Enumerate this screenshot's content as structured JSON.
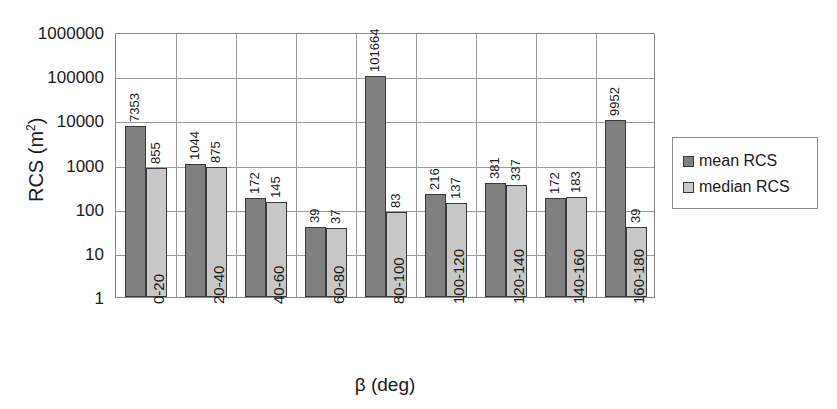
{
  "chart_data": {
    "type": "bar",
    "title": "",
    "xlabel": "β (deg)",
    "ylabel": "RCS (m²)",
    "ylabel_base": "RCS (m",
    "ylabel_sup": "2",
    "ylabel_close": ")",
    "yscale": "log",
    "ylim": [
      1,
      1000000
    ],
    "ytick_labels": [
      "1000000",
      "100000",
      "10000",
      "1000",
      "100",
      "10",
      "1"
    ],
    "ytick_values": [
      1000000,
      100000,
      10000,
      1000,
      100,
      10,
      1
    ],
    "grid": "horizontal-and-vertical",
    "legend_position": "right",
    "categories": [
      "0-20",
      "20-40",
      "40-60",
      "60-80",
      "80-100",
      "100-120",
      "120-140",
      "140-160",
      "160-180"
    ],
    "series": [
      {
        "name": "mean RCS",
        "color": "#808080",
        "values": [
          7353,
          1044,
          172,
          39,
          101664,
          216,
          381,
          172,
          9952
        ],
        "labels": [
          "7353",
          "1044",
          "172",
          "39",
          "101664",
          "216",
          "381",
          "172",
          "9952"
        ]
      },
      {
        "name": "median RCS",
        "color": "#c8c8c8",
        "values": [
          855,
          875,
          145,
          37,
          83,
          137,
          337,
          183,
          39
        ],
        "labels": [
          "855",
          "875",
          "145",
          "37",
          "83",
          "137",
          "337",
          "183",
          "39"
        ]
      }
    ]
  },
  "legend": {
    "entries": [
      {
        "label": "mean RCS"
      },
      {
        "label": "median RCS"
      }
    ]
  },
  "colors": {
    "mean": "#808080",
    "median": "#c8c8c8",
    "grid": "#9a9a9a",
    "axis": "#8a8a8a",
    "text": "#1a1a1a",
    "background": "#ffffff"
  }
}
